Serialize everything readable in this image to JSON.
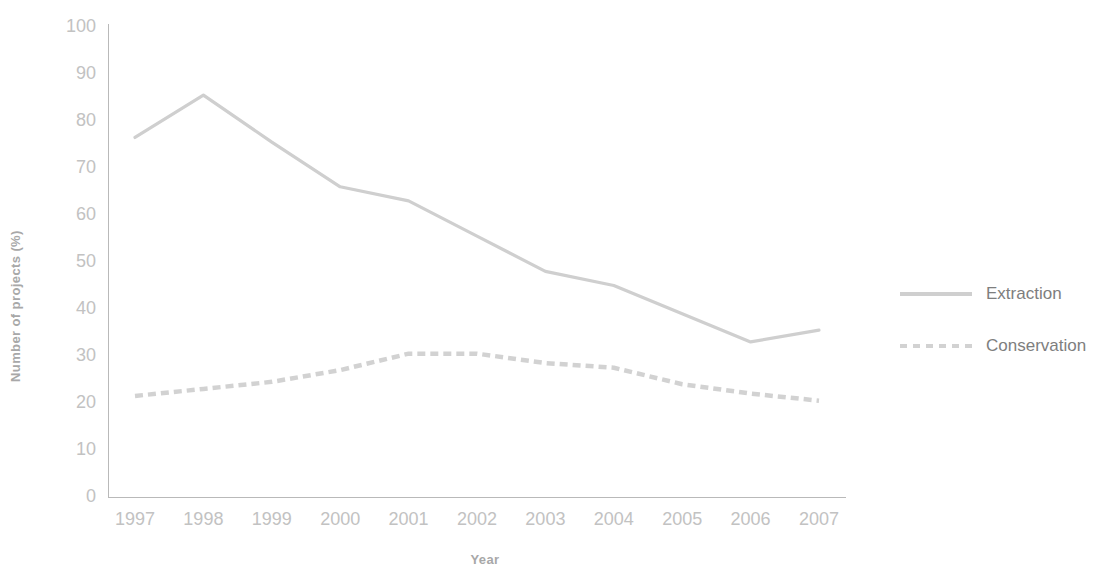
{
  "chart_data": {
    "type": "line",
    "title": "",
    "xlabel": "Year",
    "ylabel": "Number of projects (%)",
    "categories": [
      "1997",
      "1998",
      "1999",
      "2000",
      "2001",
      "2002",
      "2003",
      "2004",
      "2005",
      "2006",
      "2007"
    ],
    "x": [
      1997,
      1998,
      1999,
      2000,
      2001,
      2002,
      2003,
      2004,
      2005,
      2006,
      2007
    ],
    "xlim": [
      1997,
      2007
    ],
    "ylim": [
      0,
      100
    ],
    "y_ticks": [
      "0",
      "10",
      "20",
      "30",
      "40",
      "50",
      "60",
      "70",
      "80",
      "90",
      "100"
    ],
    "y_tick_values": [
      0,
      10,
      20,
      30,
      40,
      50,
      60,
      70,
      80,
      90,
      100
    ],
    "grid": false,
    "legend_position": "right",
    "series": [
      {
        "name": "Extraction",
        "style": "solid",
        "color": "#cfcfcf",
        "values": [
          76.5,
          85.5,
          75.5,
          66.0,
          63.0,
          55.5,
          48.0,
          45.0,
          39.0,
          33.0,
          35.5
        ]
      },
      {
        "name": "Conservation",
        "style": "dashed",
        "color": "#d2d2d2",
        "values": [
          21.5,
          23.0,
          24.5,
          27.0,
          30.5,
          30.5,
          28.5,
          27.5,
          24.0,
          22.0,
          20.5
        ]
      }
    ]
  },
  "legend": {
    "items": [
      {
        "label": "Extraction",
        "style": "solid"
      },
      {
        "label": "Conservation",
        "style": "dashed"
      }
    ]
  },
  "colors": {
    "extraction_line": "#cfcfcf",
    "conservation_line": "#d2d2d2",
    "axis": "#b9b9b9",
    "tick_text": "#c2c2c2",
    "axis_title_text": "#a8a8a8",
    "legend_text": "#7e7e7e",
    "background": "#ffffff"
  }
}
